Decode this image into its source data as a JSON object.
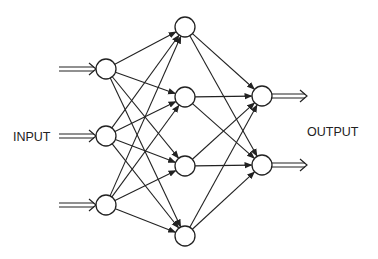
{
  "diagram": {
    "input_label": "INPUT",
    "output_label": "OUTPUT",
    "colors": {
      "stroke": "#222222",
      "node_fill": "#ffffff",
      "background": "#ffffff"
    },
    "layers": [
      {
        "name": "input",
        "nodes": [
          {
            "x": 106,
            "y": 69
          },
          {
            "x": 106,
            "y": 136
          },
          {
            "x": 106,
            "y": 205
          }
        ]
      },
      {
        "name": "hidden",
        "nodes": [
          {
            "x": 185,
            "y": 27
          },
          {
            "x": 185,
            "y": 97
          },
          {
            "x": 185,
            "y": 166
          },
          {
            "x": 185,
            "y": 236
          }
        ]
      },
      {
        "name": "output",
        "nodes": [
          {
            "x": 262,
            "y": 96
          },
          {
            "x": 262,
            "y": 165
          }
        ]
      }
    ],
    "node_radius": 10,
    "connections": "fully-connected between adjacent layers"
  }
}
